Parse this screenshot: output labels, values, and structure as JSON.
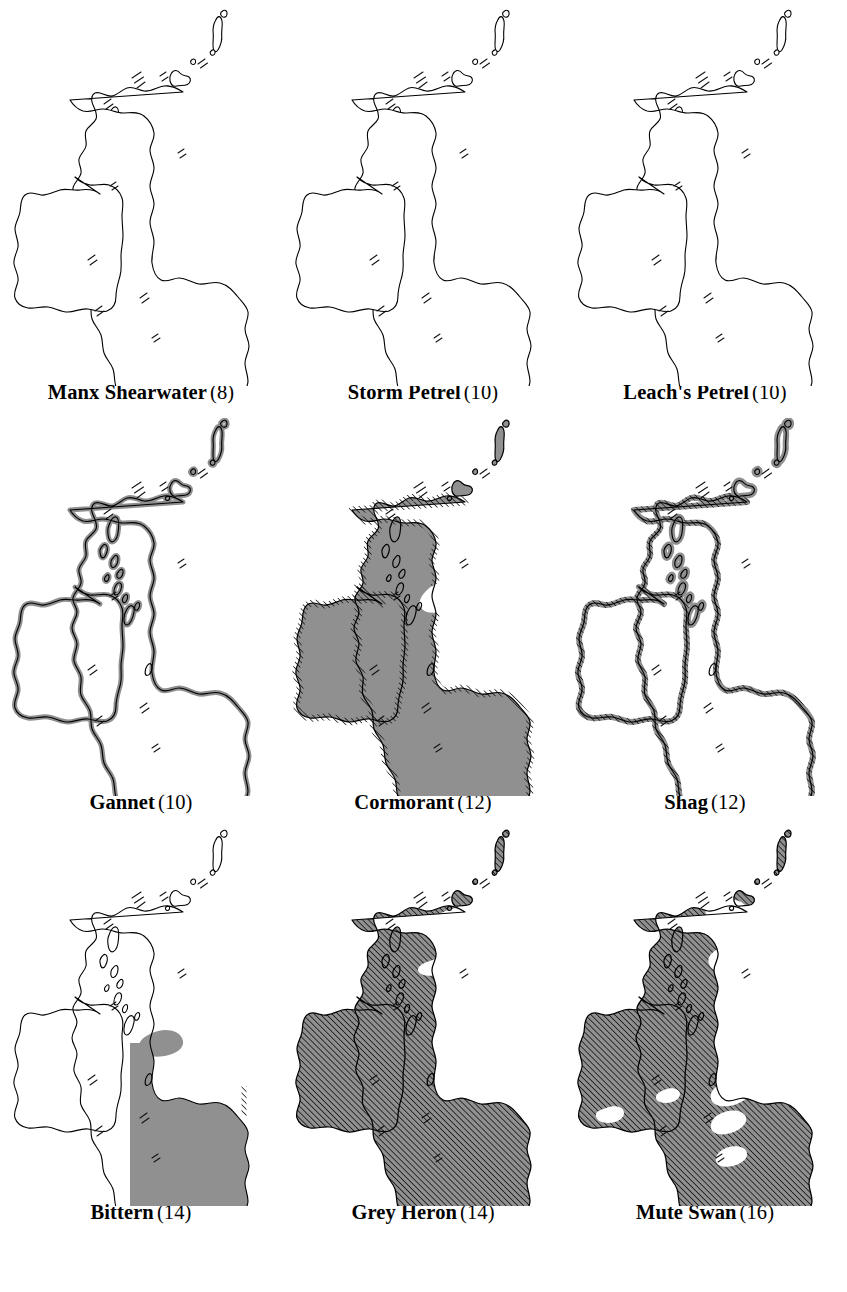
{
  "figure": {
    "kind": "distribution-map-grid",
    "columns": 3,
    "rows": 3,
    "background_color": "#ffffff",
    "outline_color": "#000000",
    "fill_gray": "#909090",
    "hatch_color": "#1a1a1a",
    "region_depicted": "Britain and Ireland"
  },
  "maps": [
    {
      "id": "manx-shearwater",
      "name": "Manx Shearwater",
      "number": "(8)",
      "fill_style": "outline",
      "shaded_regions": [],
      "coastal_band": false,
      "hatched": false
    },
    {
      "id": "storm-petrel",
      "name": "Storm Petrel",
      "number": "(10)",
      "fill_style": "outline",
      "shaded_regions": [],
      "coastal_band": false,
      "hatched": false
    },
    {
      "id": "leachs-petrel",
      "name": "Leach's Petrel",
      "number": "(10)",
      "fill_style": "outline",
      "shaded_regions": [],
      "coastal_band": false,
      "hatched": false
    },
    {
      "id": "gannet",
      "name": "Gannet",
      "number": "(10)",
      "fill_style": "coastal-band",
      "shaded_regions": [
        "coastline"
      ],
      "coastal_band": true,
      "hatched": false
    },
    {
      "id": "cormorant",
      "name": "Cormorant",
      "number": "(12)",
      "fill_style": "solid-with-voids",
      "shaded_regions": [
        "Ireland",
        "Scotland",
        "England",
        "Wales"
      ],
      "coastal_band": true,
      "hatched": true
    },
    {
      "id": "shag",
      "name": "Shag",
      "number": "(12)",
      "fill_style": "coastal-band-hatched",
      "shaded_regions": [
        "coastline"
      ],
      "coastal_band": true,
      "hatched": true
    },
    {
      "id": "bittern",
      "name": "Bittern",
      "number": "(14)",
      "fill_style": "solid-partial",
      "shaded_regions": [
        "England",
        "Wales"
      ],
      "coastal_band": false,
      "hatched": true
    },
    {
      "id": "grey-heron",
      "name": "Grey Heron",
      "number": "(14)",
      "fill_style": "hatched-full",
      "shaded_regions": [
        "Ireland",
        "Scotland",
        "England",
        "Wales"
      ],
      "coastal_band": false,
      "hatched": true
    },
    {
      "id": "mute-swan",
      "name": "Mute Swan",
      "number": "(16)",
      "fill_style": "hatched-with-voids",
      "shaded_regions": [
        "Ireland",
        "Scotland",
        "England",
        "Wales"
      ],
      "coastal_band": false,
      "hatched": true
    }
  ]
}
